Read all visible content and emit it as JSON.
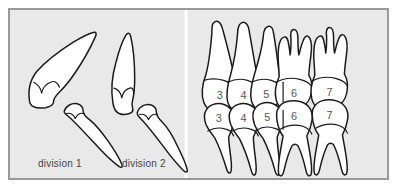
{
  "figure": {
    "background_color": "#e9e9e9",
    "border_color": "#9a9a9a",
    "outline_color": "#1a1a1a",
    "tooth_fill_color": "#ffffff",
    "label_color": "#444444",
    "number_color": "#555555"
  },
  "panels": {
    "left": {
      "name": "incisor-divisions",
      "groups": [
        {
          "id": "division-1",
          "label": "division 1",
          "teeth": [
            {
              "name": "upper-incisor",
              "position": "upper",
              "inclination": "proclined"
            },
            {
              "name": "lower-incisor",
              "position": "lower",
              "inclination": "proclined"
            }
          ]
        },
        {
          "id": "division-2",
          "label": "division 2",
          "teeth": [
            {
              "name": "upper-incisor",
              "position": "upper",
              "inclination": "retroclined"
            },
            {
              "name": "lower-incisor",
              "position": "lower",
              "inclination": "proclined"
            }
          ]
        }
      ]
    },
    "right": {
      "name": "numbered-dentition",
      "upper_row": [
        {
          "number": "3",
          "type": "canine"
        },
        {
          "number": "4",
          "type": "premolar"
        },
        {
          "number": "5",
          "type": "premolar"
        },
        {
          "number": "6",
          "type": "molar"
        },
        {
          "number": "7",
          "type": "molar"
        }
      ],
      "lower_row": [
        {
          "number": "3",
          "type": "canine"
        },
        {
          "number": "4",
          "type": "premolar"
        },
        {
          "number": "5",
          "type": "premolar"
        },
        {
          "number": "6",
          "type": "molar"
        },
        {
          "number": "7",
          "type": "molar"
        }
      ]
    }
  }
}
